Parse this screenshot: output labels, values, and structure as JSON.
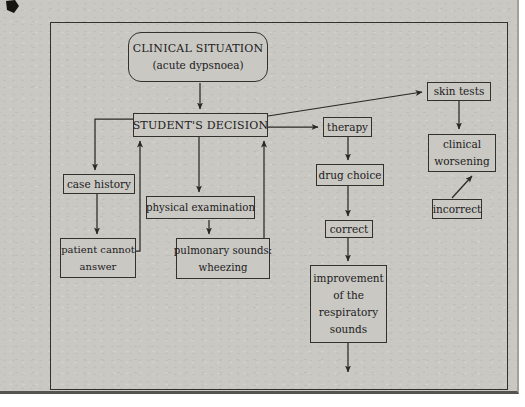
{
  "figure": {
    "type": "flowchart",
    "background_color": "#c9c8c3",
    "line_color": "#2a2822",
    "text_color": "#22201c"
  },
  "nodes": {
    "clinical_situation": {
      "shape": "rounded",
      "lines": [
        "CLINICAL SITUATION",
        "(acute dypsnoea)"
      ]
    },
    "students_decision": {
      "shape": "rect",
      "lines": [
        "STUDENT'S DECISION"
      ]
    },
    "case_history": {
      "shape": "rect",
      "lines": [
        "case history"
      ]
    },
    "patient_cannot_answer": {
      "shape": "rect",
      "lines": [
        "patient cannot",
        "answer"
      ]
    },
    "physical_examination": {
      "shape": "rect",
      "lines": [
        "physical examination"
      ]
    },
    "pulmonary_sounds": {
      "shape": "rect",
      "lines": [
        "pulmonary sounds:",
        "wheezing"
      ]
    },
    "therapy": {
      "shape": "rect",
      "lines": [
        "therapy"
      ]
    },
    "drug_choice": {
      "shape": "rect",
      "lines": [
        "drug choice"
      ]
    },
    "correct": {
      "shape": "rect",
      "lines": [
        "correct"
      ]
    },
    "improvement": {
      "shape": "rect",
      "lines": [
        "improvement",
        "of the",
        "respiratory",
        "sounds"
      ]
    },
    "skin_tests": {
      "shape": "rect",
      "lines": [
        "skin tests"
      ]
    },
    "clinical_worsening": {
      "shape": "rect",
      "lines": [
        "clinical",
        "worsening"
      ]
    },
    "incorrect": {
      "shape": "rect",
      "lines": [
        "incorrect"
      ]
    }
  },
  "edges": [
    {
      "from": "clinical_situation",
      "to": "students_decision"
    },
    {
      "from": "students_decision",
      "to": "case_history"
    },
    {
      "from": "case_history",
      "to": "patient_cannot_answer"
    },
    {
      "from": "patient_cannot_answer",
      "to": "students_decision"
    },
    {
      "from": "students_decision",
      "to": "physical_examination"
    },
    {
      "from": "physical_examination",
      "to": "pulmonary_sounds"
    },
    {
      "from": "pulmonary_sounds",
      "to": "students_decision"
    },
    {
      "from": "students_decision",
      "to": "therapy"
    },
    {
      "from": "students_decision",
      "to": "skin_tests"
    },
    {
      "from": "therapy",
      "to": "drug_choice"
    },
    {
      "from": "drug_choice",
      "to": "correct"
    },
    {
      "from": "correct",
      "to": "improvement"
    },
    {
      "from": "improvement",
      "to": "exit-bottom"
    },
    {
      "from": "skin_tests",
      "to": "clinical_worsening"
    },
    {
      "from": "incorrect",
      "to": "clinical_worsening"
    }
  ]
}
